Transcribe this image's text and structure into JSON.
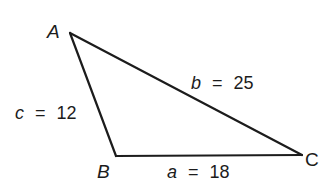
{
  "diagram": {
    "type": "triangle",
    "colors": {
      "line": "#1c1c1c",
      "background": "#ffffff"
    },
    "vertices": [
      {
        "id": "A",
        "label": "A",
        "x": 70,
        "y": 33
      },
      {
        "id": "B",
        "label": "B",
        "x": 116,
        "y": 156
      },
      {
        "id": "C",
        "label": "C",
        "x": 302,
        "y": 155
      }
    ],
    "sides": [
      {
        "id": "a",
        "from": "B",
        "to": "C",
        "variable": "a",
        "equals": "=",
        "value": "18"
      },
      {
        "id": "b",
        "from": "A",
        "to": "C",
        "variable": "b",
        "equals": "=",
        "value": "25"
      },
      {
        "id": "c",
        "from": "A",
        "to": "B",
        "variable": "c",
        "equals": "=",
        "value": "12"
      }
    ]
  }
}
